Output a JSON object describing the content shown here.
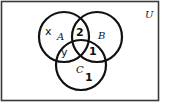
{
  "diagram": {
    "type": "venn",
    "universe": {
      "label": "U"
    },
    "sets": [
      {
        "id": "A",
        "label": "A"
      },
      {
        "id": "B",
        "label": "B"
      },
      {
        "id": "C",
        "label": "C"
      }
    ],
    "regions": {
      "A_only": "x",
      "A_and_B_only": "2",
      "A_and_C_only": "y",
      "B_and_C_only": "1",
      "C_only": "1"
    }
  }
}
